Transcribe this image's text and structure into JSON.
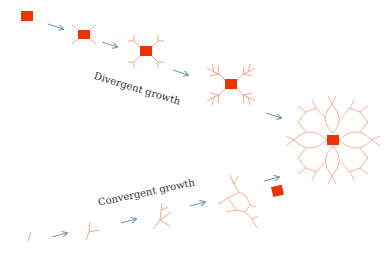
{
  "diagram": {
    "labels": {
      "divergent": "Divergent growth",
      "convergent": "Convergent growth"
    },
    "colors": {
      "core": "#ee3300",
      "branch": "#f0a890",
      "arrow": "#6f95ad",
      "text": "#333333"
    }
  }
}
